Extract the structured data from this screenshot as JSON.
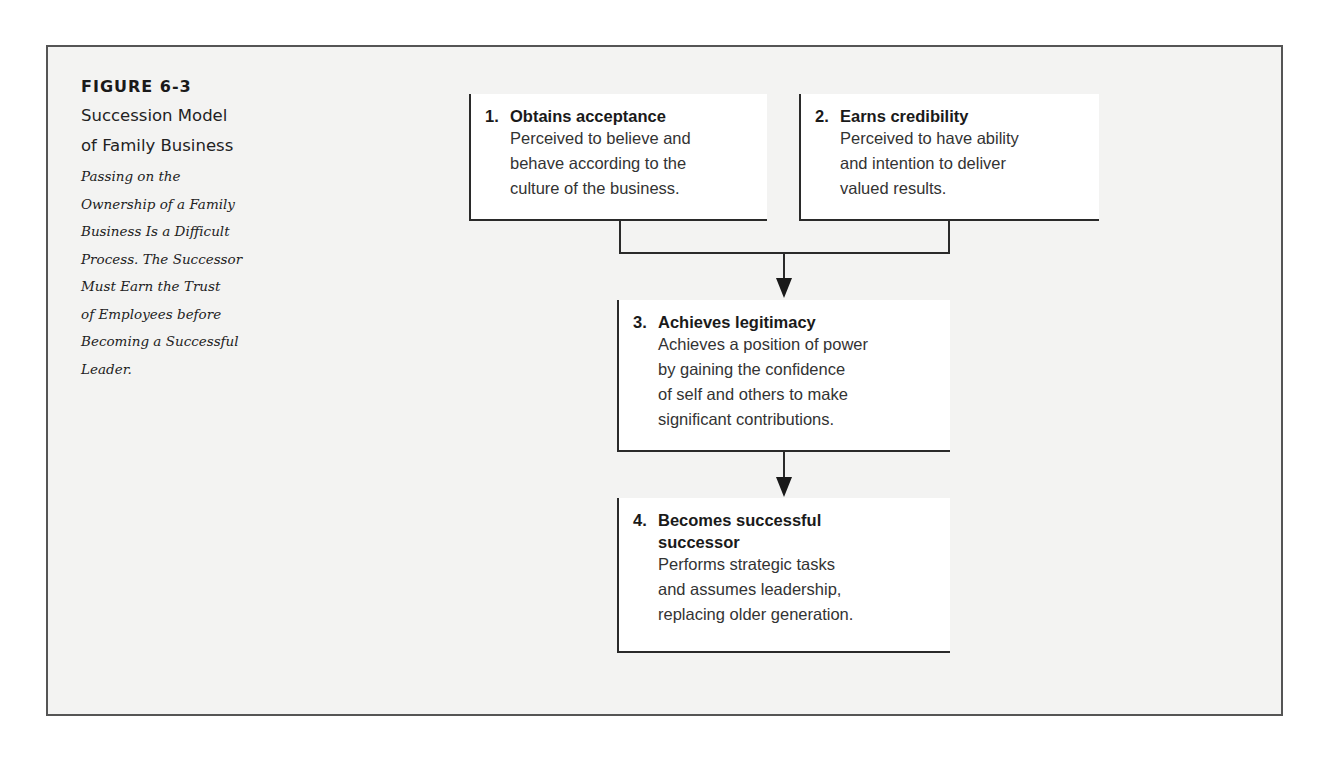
{
  "figure": {
    "label": "FIGURE 6-3",
    "title_line1": "Succession Model",
    "title_line2": "of Family Business",
    "description_lines": [
      "Passing on the",
      "Ownership of a Family",
      "Business Is a Difficult",
      "Process. The Successor",
      "Must Earn the Trust",
      "of Employees before",
      "Becoming a Successful",
      "Leader."
    ]
  },
  "steps": [
    {
      "number": "1.",
      "title": "Obtains acceptance",
      "text_lines": [
        "Perceived to believe and",
        "behave according to the",
        "culture of the business."
      ]
    },
    {
      "number": "2.",
      "title": "Earns credibility",
      "text_lines": [
        "Perceived to have ability",
        "and intention to deliver",
        "valued results."
      ]
    },
    {
      "number": "3.",
      "title": "Achieves legitimacy",
      "text_lines": [
        "Achieves a position of power",
        "by gaining the confidence",
        "of self and others to make",
        "significant contributions."
      ]
    },
    {
      "number": "4.",
      "title_lines": [
        "Becomes successful",
        "successor"
      ],
      "text_lines": [
        "Performs strategic tasks",
        "and assumes leadership,",
        "replacing older generation."
      ]
    }
  ],
  "flow": [
    {
      "from": [
        "1",
        "2"
      ],
      "to": "3"
    },
    {
      "from": [
        "3"
      ],
      "to": "4"
    }
  ],
  "colors": {
    "frame_border": "#555555",
    "frame_fill": "#f3f3f2",
    "box_fill": "#ffffff",
    "line": "#2a2a2a"
  }
}
